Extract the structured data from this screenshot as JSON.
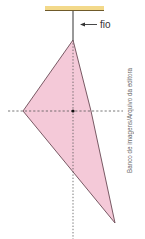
{
  "figure": {
    "string_label": "fio",
    "credit": "Banco de imagens/Arquivo da editora"
  },
  "colors": {
    "ceiling": "#f3d98a",
    "ceiling_edge": "#6f5a2a",
    "plate_fill": "#f4c9d8",
    "plate_stroke": "#6a4a55",
    "string": "#333333",
    "dashed_line": "#555555",
    "dot": "#111111"
  },
  "geometry": {
    "top_vertex": [
      73,
      40
    ],
    "left_vertex": [
      23,
      111
    ],
    "right_vertex": [
      91,
      111
    ],
    "bottom_vertex": [
      115,
      223
    ],
    "centroid": [
      73,
      111
    ]
  }
}
